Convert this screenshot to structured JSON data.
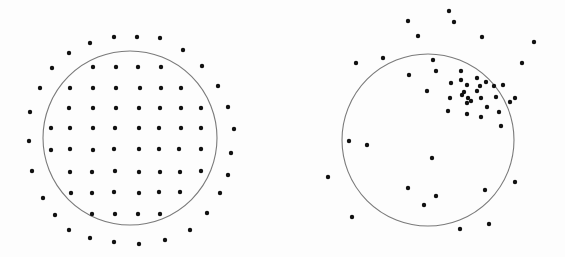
{
  "figure": {
    "width": 565,
    "height": 257,
    "background": "#fdfdfd",
    "dot_color": "#111111",
    "circle_color": "#7a7a7a",
    "dot_radius": 2.2,
    "panels": [
      {
        "name": "regular-lattice",
        "circle": {
          "cx": 130,
          "cy": 138,
          "r": 87
        },
        "dots": [
          [
            114,
            37
          ],
          [
            137,
            37
          ],
          [
            160,
            38
          ],
          [
            90,
            43
          ],
          [
            183,
            50
          ],
          [
            69,
            53
          ],
          [
            202,
            66
          ],
          [
            52,
            68
          ],
          [
            93,
            67
          ],
          [
            116,
            67
          ],
          [
            138,
            67
          ],
          [
            161,
            67
          ],
          [
            40,
            88
          ],
          [
            70,
            88
          ],
          [
            93,
            88
          ],
          [
            116,
            88
          ],
          [
            140,
            88
          ],
          [
            161,
            88
          ],
          [
            181,
            88
          ],
          [
            218,
            86
          ],
          [
            69,
            108
          ],
          [
            93,
            108
          ],
          [
            116,
            108
          ],
          [
            139,
            108
          ],
          [
            160,
            108
          ],
          [
            181,
            108
          ],
          [
            201,
            108
          ],
          [
            228,
            107
          ],
          [
            30,
            112
          ],
          [
            51,
            128
          ],
          [
            70,
            128
          ],
          [
            93,
            128
          ],
          [
            115,
            128
          ],
          [
            139,
            128
          ],
          [
            159,
            128
          ],
          [
            181,
            128
          ],
          [
            201,
            128
          ],
          [
            234,
            129
          ],
          [
            29,
            141
          ],
          [
            51,
            150
          ],
          [
            70,
            149
          ],
          [
            93,
            150
          ],
          [
            114,
            149
          ],
          [
            139,
            149
          ],
          [
            159,
            149
          ],
          [
            179,
            149
          ],
          [
            201,
            149
          ],
          [
            231,
            153
          ],
          [
            32,
            171
          ],
          [
            70,
            172
          ],
          [
            92,
            172
          ],
          [
            115,
            171
          ],
          [
            139,
            172
          ],
          [
            160,
            172
          ],
          [
            180,
            172
          ],
          [
            201,
            171
          ],
          [
            228,
            175
          ],
          [
            43,
            198
          ],
          [
            71,
            193
          ],
          [
            92,
            193
          ],
          [
            114,
            192
          ],
          [
            139,
            193
          ],
          [
            159,
            192
          ],
          [
            180,
            192
          ],
          [
            220,
            193
          ],
          [
            55,
            215
          ],
          [
            92,
            214
          ],
          [
            115,
            214
          ],
          [
            138,
            214
          ],
          [
            160,
            214
          ],
          [
            207,
            213
          ],
          [
            69,
            230
          ],
          [
            190,
            230
          ],
          [
            90,
            238
          ],
          [
            114,
            242
          ],
          [
            139,
            244
          ],
          [
            165,
            240
          ]
        ]
      },
      {
        "name": "clustered-distribution",
        "circle": {
          "cx": 428,
          "cy": 140,
          "r": 86
        },
        "dots": [
          [
            449,
            11
          ],
          [
            408,
            21
          ],
          [
            454,
            22
          ],
          [
            418,
            36
          ],
          [
            482,
            37
          ],
          [
            534,
            42
          ],
          [
            356,
            63
          ],
          [
            383,
            58
          ],
          [
            433,
            60
          ],
          [
            522,
            63
          ],
          [
            436,
            71
          ],
          [
            461,
            71
          ],
          [
            409,
            75
          ],
          [
            461,
            80
          ],
          [
            477,
            78
          ],
          [
            451,
            83
          ],
          [
            467,
            85
          ],
          [
            480,
            86
          ],
          [
            486,
            82
          ],
          [
            464,
            92
          ],
          [
            477,
            91
          ],
          [
            494,
            86
          ],
          [
            503,
            85
          ],
          [
            427,
            91
          ],
          [
            450,
            98
          ],
          [
            462,
            95
          ],
          [
            468,
            98
          ],
          [
            481,
            98
          ],
          [
            496,
            97
          ],
          [
            515,
            98
          ],
          [
            448,
            111
          ],
          [
            467,
            103
          ],
          [
            471,
            101
          ],
          [
            487,
            107
          ],
          [
            499,
            112
          ],
          [
            510,
            102
          ],
          [
            467,
            114
          ],
          [
            481,
            117
          ],
          [
            501,
            126
          ],
          [
            349,
            141
          ],
          [
            367,
            145
          ],
          [
            432,
            158
          ],
          [
            328,
            177
          ],
          [
            515,
            182
          ],
          [
            408,
            188
          ],
          [
            485,
            190
          ],
          [
            436,
            196
          ],
          [
            424,
            205
          ],
          [
            352,
            217
          ],
          [
            489,
            224
          ],
          [
            460,
            229
          ]
        ]
      }
    ]
  }
}
